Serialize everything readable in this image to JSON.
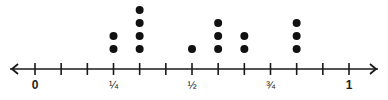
{
  "chart_data": {
    "type": "scatter",
    "subtype": "dot_plot",
    "title": "",
    "xlabel": "",
    "ylabel": "",
    "xlim": [
      0,
      1
    ],
    "tick_step": "1/12",
    "ticks": [
      0,
      0.0833,
      0.1667,
      0.25,
      0.3333,
      0.4167,
      0.5,
      0.5833,
      0.6667,
      0.75,
      0.8333,
      0.9167,
      1
    ],
    "tick_labels": [
      {
        "value": 0,
        "label": "0"
      },
      {
        "value": 0.25,
        "label": "¼"
      },
      {
        "value": 0.5,
        "label": "½"
      },
      {
        "value": 0.75,
        "label": "¾"
      },
      {
        "value": 1,
        "label": "1"
      }
    ],
    "points": [
      {
        "x": "3/12",
        "value": 0.25,
        "count": 2
      },
      {
        "x": "4/12",
        "value": 0.3333,
        "count": 4
      },
      {
        "x": "6/12",
        "value": 0.5,
        "count": 1
      },
      {
        "x": "7/12",
        "value": 0.5833,
        "count": 3
      },
      {
        "x": "8/12",
        "value": 0.6667,
        "count": 2
      },
      {
        "x": "10/12",
        "value": 0.8333,
        "count": 3
      }
    ],
    "grid": false,
    "legend": null,
    "arrows": "both ends"
  },
  "style": {
    "line_color": "#1a1a1a",
    "dot_color": "#111111"
  }
}
